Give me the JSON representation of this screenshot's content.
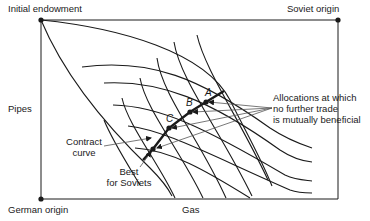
{
  "diagram": {
    "type": "edgeworth-box",
    "labels": {
      "initial_endowment": "Initial endowment",
      "soviet_origin": "Soviet origin",
      "german_origin": "German origin",
      "y_axis": "Pipes",
      "x_axis": "Gas",
      "contract_curve_line1": "Contract",
      "contract_curve_line2": "curve",
      "best_soviets_line1": "Best",
      "best_soviets_line2": "for Soviets",
      "allocations_line1": "Allocations at which",
      "allocations_line2": "no further trade",
      "allocations_line3": "is mutually beneficial",
      "point_a": "A",
      "point_b": "B",
      "point_c": "C"
    },
    "colors": {
      "line": "#1a1a1a",
      "arrow": "#555555",
      "background": "#ffffff"
    }
  }
}
